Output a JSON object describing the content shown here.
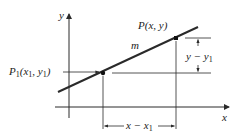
{
  "diagram": {
    "axes": {
      "x_label": "x",
      "y_label": "y"
    },
    "line": {
      "slope_label": "m"
    },
    "points": [
      {
        "name": "P1",
        "label_main": "P",
        "label_sub": "1",
        "label_coords": "(x",
        "label_coords_sub": "1",
        "label_coords_mid": ", y",
        "label_coords_sub2": "1",
        "label_coords_end": ")"
      },
      {
        "name": "P",
        "label": "P(x, y)"
      }
    ],
    "dimensions": {
      "vertical": {
        "main": "y − y",
        "sub": "1"
      },
      "horizontal": {
        "main": "x − x",
        "sub": "1"
      }
    },
    "colors": {
      "ink": "#2a2a2a",
      "background": "#ffffff"
    }
  }
}
